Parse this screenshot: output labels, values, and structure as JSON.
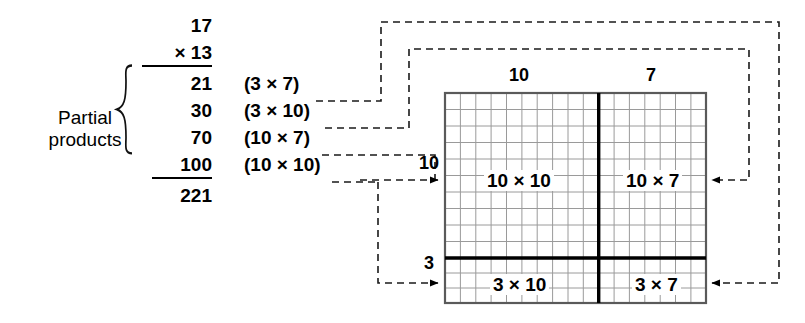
{
  "figure": {
    "title_icon": "multiplication-area-model",
    "problem": {
      "multiplicand": "17",
      "multiplier": "× 13",
      "total": "221"
    },
    "bracket_label_line1": "Partial",
    "bracket_label_line2": "products",
    "partial_products": [
      {
        "value": "21",
        "expression": "(3 × 7)"
      },
      {
        "value": "30",
        "expression": "(3 × 10)"
      },
      {
        "value": "70",
        "expression": "(10 × 7)"
      },
      {
        "value": "100",
        "expression": "(10 × 10)"
      }
    ],
    "grid": {
      "top_labels": {
        "left": "10",
        "right": "7"
      },
      "side_labels": {
        "top": "10",
        "bottom": "3"
      },
      "quadrants": {
        "top_left": "10 × 10",
        "top_right": "10 × 7",
        "bottom_left": "3 × 10",
        "bottom_right": "3 × 7"
      },
      "columns_left": 10,
      "columns_right": 7,
      "rows_top": 10,
      "rows_bottom": 3
    },
    "colors": {
      "ink": "#000000",
      "grid_line": "#9a9a9a",
      "grid_border": "#5a5a5a",
      "divider": "#000000",
      "background": "#ffffff"
    }
  }
}
